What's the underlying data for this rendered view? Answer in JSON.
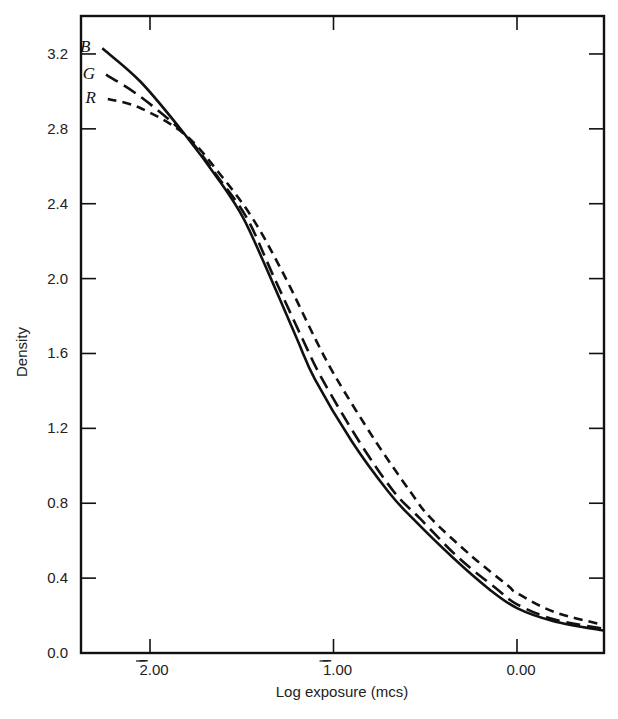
{
  "chart_data": {
    "type": "line",
    "title": "",
    "xlabel": "Log exposure (mcs)",
    "ylabel": "Density",
    "xlim": [
      -2.38,
      0.47
    ],
    "ylim": [
      0.0,
      3.4
    ],
    "grid": false,
    "legend_position": "inline labels at left end of curves",
    "x_ticks": [
      {
        "value": -2,
        "label": "2.00",
        "bar_digit": "2",
        "rest": ".00",
        "note": "bar notation (negative characteristic)"
      },
      {
        "value": -1,
        "label": "1.00",
        "bar_digit": "1",
        "rest": ".00",
        "note": "bar notation (negative characteristic)"
      },
      {
        "value": 0,
        "label": "0.00",
        "bar_digit": "",
        "rest": "0.00"
      }
    ],
    "y_ticks": [
      "0.0",
      "0.4",
      "0.8",
      "1.2",
      "1.6",
      "2.0",
      "2.4",
      "2.8",
      "3.2"
    ],
    "series": [
      {
        "name": "B",
        "style": "solid",
        "x": [
          -2.26,
          -2.05,
          -1.81,
          -1.62,
          -1.49,
          -1.35,
          -1.2,
          -1.1,
          -0.9,
          -0.7,
          -0.57,
          -0.35,
          -0.15,
          0.0,
          0.2,
          0.47
        ],
        "y": [
          3.23,
          3.05,
          2.77,
          2.52,
          2.32,
          2.02,
          1.68,
          1.46,
          1.13,
          0.86,
          0.72,
          0.51,
          0.34,
          0.24,
          0.17,
          0.12
        ]
      },
      {
        "name": "G",
        "style": "long-dash",
        "x": [
          -2.24,
          -2.05,
          -1.81,
          -1.62,
          -1.47,
          -1.33,
          -1.17,
          -1.06,
          -0.86,
          -0.67,
          -0.53,
          -0.32,
          -0.12,
          0.0,
          0.2,
          0.47
        ],
        "y": [
          3.09,
          2.97,
          2.77,
          2.53,
          2.32,
          2.02,
          1.68,
          1.46,
          1.13,
          0.86,
          0.72,
          0.51,
          0.35,
          0.26,
          0.18,
          0.13
        ]
      },
      {
        "name": "R",
        "style": "short-dash",
        "x": [
          -2.23,
          -2.05,
          -1.81,
          -1.62,
          -1.44,
          -1.27,
          -1.1,
          -0.98,
          -0.77,
          -0.58,
          -0.47,
          -0.25,
          -0.05,
          0.0,
          0.2,
          0.47
        ],
        "y": [
          2.96,
          2.91,
          2.77,
          2.56,
          2.32,
          2.02,
          1.68,
          1.46,
          1.13,
          0.86,
          0.72,
          0.52,
          0.36,
          0.32,
          0.22,
          0.15
        ]
      }
    ]
  },
  "axes": {
    "x_title": "Log exposure (mcs)",
    "y_title": "Density"
  },
  "labels": {
    "B": "B",
    "G": "G",
    "R": "R"
  }
}
